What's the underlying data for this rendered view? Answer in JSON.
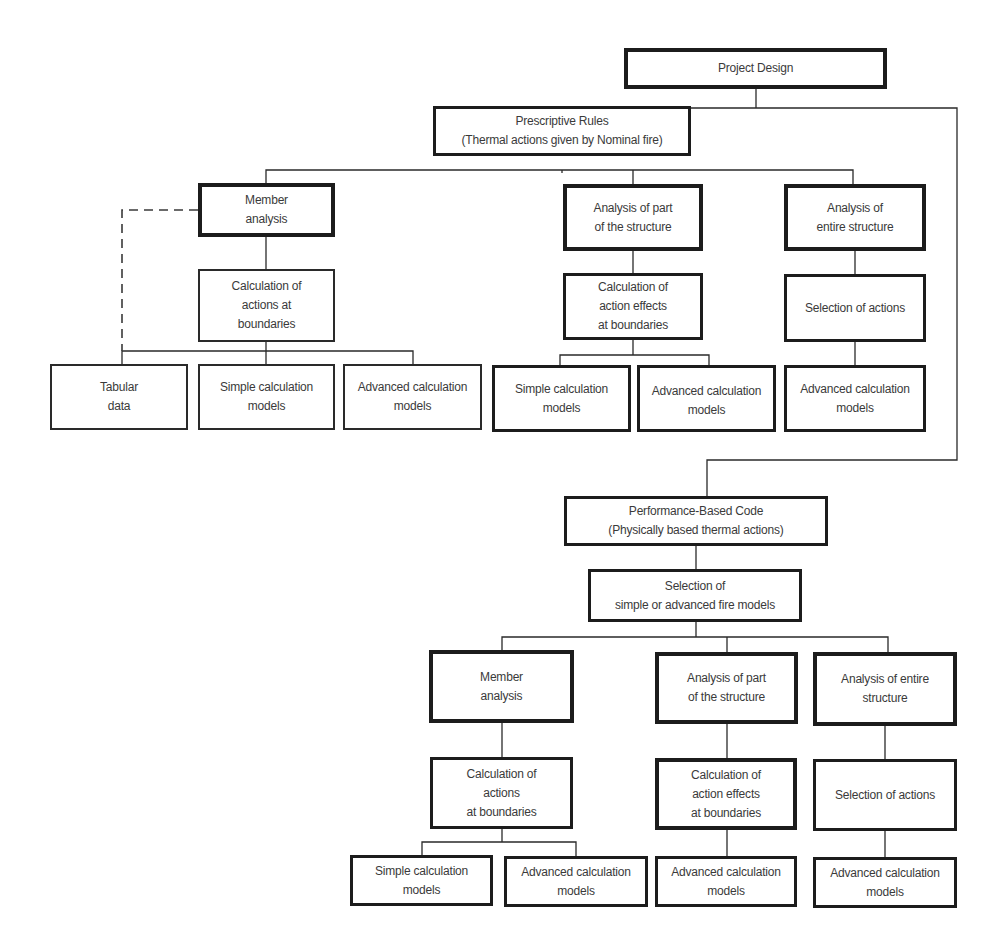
{
  "diagram": {
    "root": {
      "label": "Project Design"
    },
    "prescriptive": {
      "label": "Prescriptive Rules\n(Thermal actions given by Nominal fire)",
      "branches": {
        "member": {
          "label": "Member\nanalysis",
          "calc": "Calculation of\nactions at\nboundaries",
          "leaves": [
            "Tabular\ndata",
            "Simple calculation\nmodels",
            "Advanced calculation\nmodels"
          ]
        },
        "part": {
          "label": "Analysis of part\nof the structure",
          "calc": "Calculation of\naction effects\nat boundaries",
          "leaves": [
            "Simple calculation\nmodels",
            "Advanced calculation\nmodels"
          ]
        },
        "entire": {
          "label": "Analysis of\nentire structure",
          "calc": "Selection of actions",
          "leaves": [
            "Advanced calculation\nmodels"
          ]
        }
      }
    },
    "performance": {
      "label": "Performance-Based Code\n(Physically based thermal actions)",
      "selection": "Selection of\nsimple or advanced fire models",
      "branches": {
        "member": {
          "label": "Member\nanalysis",
          "calc": "Calculation of\nactions\nat boundaries",
          "leaves": [
            "Simple calculation\nmodels",
            "Advanced calculation\nmodels"
          ]
        },
        "part": {
          "label": "Analysis of part\nof the structure",
          "calc": "Calculation of\naction effects\nat boundaries",
          "leaves": [
            "Advanced calculation\nmodels"
          ]
        },
        "entire": {
          "label": "Analysis of entire\nstructure",
          "calc": "Selection of actions",
          "leaves": [
            "Advanced calculation\nmodels"
          ]
        }
      }
    },
    "colors": {
      "line": "#2a2a2a",
      "box_border": "#1c1c1c",
      "text": "#3a3a3a",
      "background": "#ffffff"
    }
  }
}
